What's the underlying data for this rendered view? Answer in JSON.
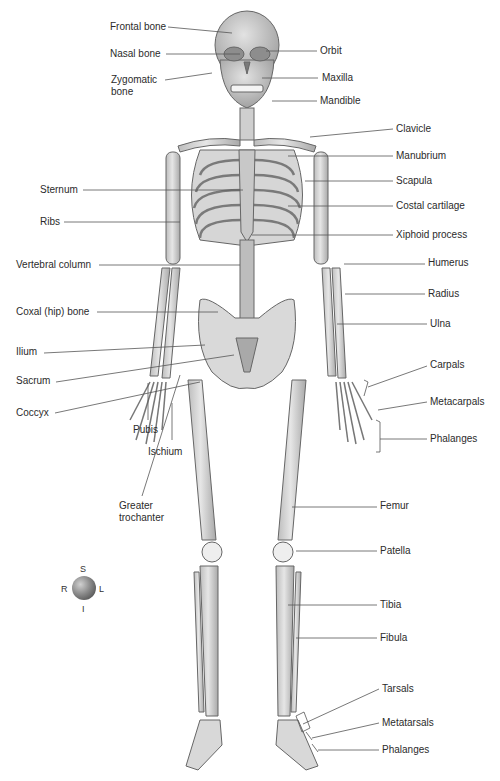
{
  "figure": {
    "bone_fill": "#dcdcdc",
    "bone_stroke": "#6a6a6a",
    "leader_color": "#555555"
  },
  "labels_left": [
    {
      "id": "frontal-bone",
      "text": "Frontal bone",
      "x": 110,
      "y": 21,
      "line": [
        168,
        27,
        232,
        33
      ]
    },
    {
      "id": "nasal-bone",
      "text": "Nasal bone",
      "x": 110,
      "y": 48,
      "line": [
        166,
        54,
        240,
        54
      ]
    },
    {
      "id": "zygomatic-bone",
      "text": "Zygomatic bone",
      "lines": [
        "Zygomatic",
        "bone"
      ],
      "x": 111,
      "y": 74,
      "line": [
        165,
        80,
        212,
        73
      ]
    },
    {
      "id": "sternum",
      "text": "Sternum",
      "x": 40,
      "y": 184,
      "line": [
        83,
        190,
        243,
        190
      ]
    },
    {
      "id": "ribs",
      "text": "Ribs",
      "x": 40,
      "y": 216,
      "line": [
        64,
        222,
        180,
        222
      ]
    },
    {
      "id": "vertebral-column",
      "text": "Vertebral column",
      "x": 16,
      "y": 259,
      "line": [
        99,
        265,
        240,
        265
      ]
    },
    {
      "id": "coxal-hip-bone",
      "text": "Coxal (hip) bone",
      "x": 16,
      "y": 306,
      "line": [
        97,
        312,
        218,
        312
      ]
    },
    {
      "id": "ilium",
      "text": "Ilium",
      "x": 16,
      "y": 346,
      "line": [
        44,
        353,
        205,
        345
      ]
    },
    {
      "id": "sacrum",
      "text": "Sacrum",
      "x": 16,
      "y": 375,
      "line": [
        56,
        382,
        234,
        355
      ]
    },
    {
      "id": "coccyx",
      "text": "Coccyx",
      "x": 16,
      "y": 407,
      "line": [
        55,
        413,
        200,
        382
      ]
    },
    {
      "id": "greater-trochanter",
      "text": "Greater trochanter",
      "lines": [
        "Greater",
        "trochanter"
      ],
      "x": 119,
      "y": 500,
      "line": [
        142,
        496,
        180,
        375
      ]
    }
  ],
  "labels_center": [
    {
      "id": "pubis",
      "text": "Pubis",
      "x": 133,
      "y": 424,
      "line": [
        148,
        420,
        148,
        383
      ]
    },
    {
      "id": "ischium",
      "text": "Ischium",
      "x": 148,
      "y": 446,
      "line": [
        172,
        440,
        172,
        403
      ]
    }
  ],
  "labels_right": [
    {
      "id": "orbit",
      "text": "Orbit",
      "x": 320,
      "y": 45,
      "line": [
        266,
        51,
        317,
        51
      ]
    },
    {
      "id": "maxilla",
      "text": "Maxilla",
      "x": 322,
      "y": 72,
      "line": [
        262,
        78,
        318,
        78
      ]
    },
    {
      "id": "mandible",
      "text": "Mandible",
      "x": 320,
      "y": 95,
      "line": [
        272,
        101,
        317,
        101
      ]
    },
    {
      "id": "clavicle",
      "text": "Clavicle",
      "x": 396,
      "y": 123,
      "line": [
        310,
        137,
        393,
        129
      ]
    },
    {
      "id": "manubrium",
      "text": "Manubrium",
      "x": 396,
      "y": 150,
      "line": [
        288,
        156,
        393,
        156
      ]
    },
    {
      "id": "scapula",
      "text": "Scapula",
      "x": 396,
      "y": 175,
      "line": [
        305,
        181,
        393,
        181
      ]
    },
    {
      "id": "costal-cartilage",
      "text": "Costal cartilage",
      "x": 396,
      "y": 200,
      "line": [
        288,
        206,
        393,
        206
      ]
    },
    {
      "id": "xiphoid-process",
      "text": "Xiphoid process",
      "x": 396,
      "y": 229,
      "line": [
        252,
        235,
        393,
        235
      ]
    },
    {
      "id": "humerus",
      "text": "Humerus",
      "x": 428,
      "y": 257,
      "line": [
        344,
        264,
        425,
        264
      ]
    },
    {
      "id": "radius",
      "text": "Radius",
      "x": 428,
      "y": 288,
      "line": [
        345,
        294,
        425,
        294
      ]
    },
    {
      "id": "ulna",
      "text": "Ulna",
      "x": 430,
      "y": 318,
      "line": [
        337,
        324,
        427,
        324
      ]
    },
    {
      "id": "carpals",
      "text": "Carpals",
      "x": 430,
      "y": 359,
      "line": [
        368,
        387,
        427,
        366
      ]
    },
    {
      "id": "metacarpals",
      "text": "Metacarpals",
      "x": 430,
      "y": 396,
      "line": [
        378,
        410,
        427,
        402
      ]
    },
    {
      "id": "phalanges-hand",
      "text": "Phalanges",
      "x": 430,
      "y": 433,
      "line": [
        380,
        439,
        427,
        439
      ]
    },
    {
      "id": "femur",
      "text": "Femur",
      "x": 380,
      "y": 500,
      "line": [
        292,
        507,
        377,
        507
      ]
    },
    {
      "id": "patella",
      "text": "Patella",
      "x": 380,
      "y": 545,
      "line": [
        296,
        551,
        377,
        551
      ]
    },
    {
      "id": "tibia",
      "text": "Tibia",
      "x": 380,
      "y": 599,
      "line": [
        288,
        605,
        377,
        605
      ]
    },
    {
      "id": "fibula",
      "text": "Fibula",
      "x": 380,
      "y": 632,
      "line": [
        296,
        638,
        377,
        638
      ]
    },
    {
      "id": "tarsals",
      "text": "Tarsals",
      "x": 382,
      "y": 683,
      "line": [
        303,
        724,
        379,
        689
      ]
    },
    {
      "id": "metatarsals",
      "text": "Metatarsals",
      "x": 382,
      "y": 717,
      "line": [
        312,
        738,
        379,
        723
      ]
    },
    {
      "id": "phalanges-foot",
      "text": "Phalanges",
      "x": 382,
      "y": 744,
      "line": [
        318,
        750,
        379,
        750
      ]
    }
  ],
  "compass": {
    "superior": "S",
    "inferior": "I",
    "right": "R",
    "left": "L"
  }
}
